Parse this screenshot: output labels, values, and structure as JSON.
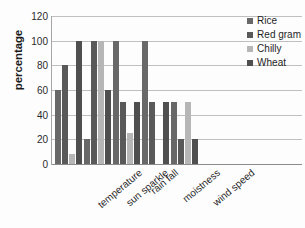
{
  "chart_data": {
    "type": "bar",
    "title": "",
    "xlabel": "",
    "ylabel": "percentage",
    "ylim": [
      0,
      120
    ],
    "ytick_step": 20,
    "yticks": [
      120,
      100,
      80,
      60,
      40,
      20,
      0
    ],
    "grid": true,
    "legend_position": "top-right",
    "categories": [
      "temperature",
      "sun sparkle",
      "rain fall",
      "moistness",
      "wind speed"
    ],
    "series": [
      {
        "name": "Rice",
        "color": "#686868",
        "values": [
          60,
          20,
          100,
          100,
          50
        ]
      },
      {
        "name": "Red gram",
        "color": "#595959",
        "values": [
          80,
          100,
          50,
          50,
          20
        ]
      },
      {
        "name": "Chilly",
        "color": "#b6b6b6",
        "values": [
          8,
          100,
          25,
          0,
          50
        ]
      },
      {
        "name": "Wheat",
        "color": "#4f4f4f",
        "values": [
          100,
          60,
          50,
          50,
          20
        ]
      }
    ]
  }
}
